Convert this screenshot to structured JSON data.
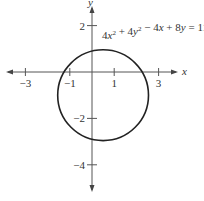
{
  "chart_data": {
    "type": "line",
    "title": "",
    "equation": "4x² + 4y² − 4x + 8y = 11",
    "shape": "circle",
    "center": [
      0.5,
      -1
    ],
    "radius": 2,
    "xlabel": "x",
    "ylabel": "y",
    "x_ticks": [
      -3,
      -1,
      1,
      3
    ],
    "x_tick_labels": [
      "−3",
      "−1",
      "1",
      "3"
    ],
    "y_ticks": [
      2,
      -2,
      -4
    ],
    "y_tick_labels": [
      "2",
      "−2",
      "−4"
    ],
    "xlim": [
      -4,
      4
    ],
    "ylim": [
      -4.5,
      3
    ],
    "grid": false,
    "legend": null
  },
  "colors": {
    "axis": "#555555",
    "curve": "#222222",
    "text": "#333333"
  }
}
